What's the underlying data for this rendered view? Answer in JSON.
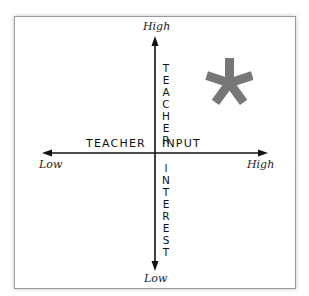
{
  "diagram": {
    "type": "quadrant",
    "vertical_axis": {
      "label": "TEACHER INTEREST",
      "label_upper": "TEACHER",
      "label_lower": "INTEREST",
      "top_label": "High",
      "bottom_label": "Low"
    },
    "horizontal_axis": {
      "label": "TEACHER INPUT",
      "label_left": "TEACHER",
      "label_right": "INPUT",
      "left_label": "Low",
      "right_label": "High"
    },
    "marker": {
      "symbol": "asterisk",
      "quadrant": "high-input-high-interest",
      "color": "#777777"
    },
    "colors": {
      "axis": "#111111",
      "frame_border": "#9a9a9a",
      "background": "#ffffff"
    }
  }
}
